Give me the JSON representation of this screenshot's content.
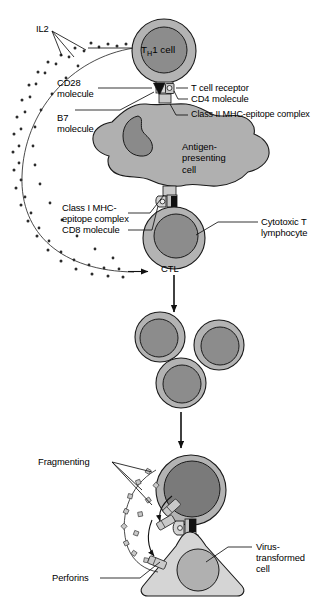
{
  "figure": {
    "colors": {
      "cell_fill": "#b3b3b3",
      "nucleus_fill": "#8c8c8c",
      "apc_fill": "#b0b0b0",
      "apc_nucleus": "#8a8a8a",
      "target_fill": "#d5d5d5",
      "target_nucleus": "#b0b0b0",
      "effector_nucleus": "#7a7a7a",
      "granule_fill": "#c9c9c9",
      "outline": "#1a1a1a",
      "dot": "#2b2b2b"
    }
  },
  "labels": {
    "il2": "IL2",
    "cd28": "CD28\nmolecule",
    "b7": "B7\nmolecule",
    "tcr": "T cell receptor",
    "cd4": "CD4 molecule",
    "mhc2": "Class II MHC-epitope complex",
    "mhc1": "Class I MHC-\nepitope complex",
    "cd8": "CD8 molecule",
    "ctl_full": "Cytotoxic T\nlymphocyte",
    "fragmenting": "Fragmenting",
    "perforins": "Perforins",
    "virus_cell": "Virus-\ntransformed\ncell"
  },
  "cells": {
    "th1": {
      "name_prefix": "T",
      "name_sub": "H",
      "name_suffix": "1 cell"
    },
    "apc": "Antigen-\npresenting\ncell",
    "ctl_abbrev": "CTL"
  },
  "clones": [
    {
      "id": "clone-1"
    },
    {
      "id": "clone-2"
    },
    {
      "id": "clone-3"
    }
  ]
}
